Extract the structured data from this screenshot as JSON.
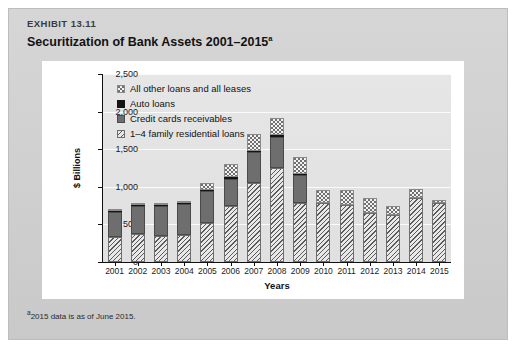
{
  "exhibit": {
    "label": "EXHIBIT 13.11",
    "title": "Securitization of Bank Assets 2001–2015",
    "title_superscript": "a",
    "footnote_superscript": "a",
    "footnote": "2015 data is as of June 2015."
  },
  "legend": {
    "items": [
      {
        "label": "All other loans and all leases",
        "swatch": "dotted-stipple-swatch",
        "color": "#f2f2f2"
      },
      {
        "label": "Auto loans",
        "swatch": "solid-black-swatch",
        "color": "#141414"
      },
      {
        "label": "Credit cards receivables",
        "swatch": "solid-gray-swatch",
        "color": "#6e6e6e"
      },
      {
        "label": "1–4 family residential loans",
        "swatch": "diagonal-hatch-swatch",
        "color": "#cfcfcf"
      }
    ]
  },
  "chart_data": {
    "type": "bar",
    "subtype": "stacked",
    "title": "Securitization of Bank Assets 2001–2015",
    "xlabel": "Years",
    "ylabel": "$ Billions",
    "ylim": [
      0,
      2500
    ],
    "yticks": [
      0,
      500,
      1000,
      1500,
      2000,
      2500
    ],
    "ytick_labels": [
      "0",
      "500",
      "1,000",
      "1,500",
      "2,000",
      "2,500"
    ],
    "grid": true,
    "grid_axis": "y",
    "legend_position": "top-left",
    "categories": [
      "2001",
      "2002",
      "2003",
      "2004",
      "2005",
      "2006",
      "2007",
      "2008",
      "2009",
      "2010",
      "2011",
      "2012",
      "2013",
      "2014",
      "2015"
    ],
    "stack_order_bottom_to_top": [
      "1–4 family residential loans",
      "Credit cards receivables",
      "Auto loans",
      "All other loans and all leases"
    ],
    "series": [
      {
        "name": "1–4 family residential loans",
        "key": "residential",
        "values": [
          330,
          375,
          345,
          365,
          525,
          740,
          1045,
          1255,
          780,
          780,
          760,
          655,
          620,
          845,
          790
        ]
      },
      {
        "name": "Credit cards receivables",
        "key": "creditcards",
        "values": [
          340,
          370,
          400,
          410,
          415,
          365,
          415,
          410,
          375,
          0,
          0,
          0,
          0,
          0,
          0
        ]
      },
      {
        "name": "Auto loans",
        "key": "auto",
        "values": [
          10,
          10,
          10,
          10,
          20,
          20,
          15,
          20,
          15,
          0,
          0,
          0,
          0,
          0,
          0
        ]
      },
      {
        "name": "All other loans and all leases",
        "key": "other",
        "values": [
          20,
          25,
          25,
          25,
          90,
          175,
          225,
          225,
          230,
          180,
          200,
          200,
          120,
          120,
          30
        ]
      }
    ],
    "totals": [
      700,
      780,
      780,
      810,
      1050,
      1300,
      1700,
      1910,
      1400,
      960,
      960,
      855,
      740,
      965,
      820
    ]
  }
}
